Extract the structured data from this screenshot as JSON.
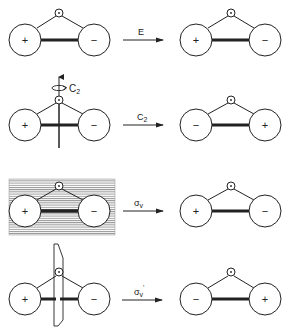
{
  "figure": {
    "colors": {
      "ink": "#222222",
      "hatch": "#9a9a9a",
      "background": "#ffffff"
    }
  },
  "rows": [
    {
      "operation": "E",
      "operation_sub": "",
      "operation_prime": "",
      "before": {
        "left_sign": "+",
        "right_sign": "−"
      },
      "after": {
        "left_sign": "+",
        "right_sign": "−"
      },
      "element": "none"
    },
    {
      "operation": "C",
      "operation_sub": "2",
      "operation_prime": "",
      "axis_label": "C",
      "axis_label_sub": "2",
      "before": {
        "left_sign": "+",
        "right_sign": "−"
      },
      "after": {
        "left_sign": "−",
        "right_sign": "+"
      },
      "element": "rotation-axis"
    },
    {
      "operation": "σ",
      "operation_sub": "v",
      "operation_prime": "",
      "before": {
        "left_sign": "+",
        "right_sign": "−"
      },
      "after": {
        "left_sign": "+",
        "right_sign": "−"
      },
      "element": "mirror-plane-molecular"
    },
    {
      "operation": "σ",
      "operation_sub": "v",
      "operation_prime": "'",
      "before": {
        "left_sign": "+",
        "right_sign": "−"
      },
      "after": {
        "left_sign": "−",
        "right_sign": "+"
      },
      "element": "mirror-plane-perpendicular"
    }
  ]
}
